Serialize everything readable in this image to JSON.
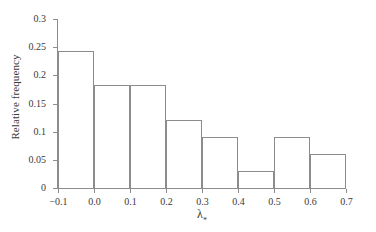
{
  "chart_data": {
    "type": "bar",
    "title": "",
    "subtitle": "",
    "xlabel": "λ",
    "xlabel_subscript": "*",
    "ylabel": "Relative frequency",
    "xlim": [
      -0.1,
      0.7
    ],
    "ylim": [
      0,
      0.3
    ],
    "grid": false,
    "legend": "none",
    "bin_width": 0.1,
    "bin_edges": [
      -0.1,
      0.0,
      0.1,
      0.2,
      0.3,
      0.4,
      0.5,
      0.6,
      0.7
    ],
    "categories": [
      "-0.1 to 0.0",
      "0.0 to 0.1",
      "0.1 to 0.2",
      "0.2 to 0.3",
      "0.3 to 0.4",
      "0.4 to 0.5",
      "0.5 to 0.6",
      "0.6 to 0.7"
    ],
    "values": [
      0.243,
      0.182,
      0.182,
      0.121,
      0.091,
      0.03,
      0.091,
      0.061
    ],
    "xticks": [
      {
        "value": -0.1,
        "label": "−0.1"
      },
      {
        "value": 0.0,
        "label": "0.0"
      },
      {
        "value": 0.1,
        "label": "0.1"
      },
      {
        "value": 0.2,
        "label": "0.2"
      },
      {
        "value": 0.3,
        "label": "0.3"
      },
      {
        "value": 0.4,
        "label": "0.4"
      },
      {
        "value": 0.5,
        "label": "0.5"
      },
      {
        "value": 0.6,
        "label": "0.6"
      },
      {
        "value": 0.7,
        "label": "0.7"
      }
    ],
    "yticks": [
      {
        "value": 0.0,
        "label": "0"
      },
      {
        "value": 0.05,
        "label": "0.05"
      },
      {
        "value": 0.1,
        "label": "0.1"
      },
      {
        "value": 0.15,
        "label": "0.15"
      },
      {
        "value": 0.2,
        "label": "0.2"
      },
      {
        "value": 0.25,
        "label": "0.25"
      },
      {
        "value": 0.3,
        "label": "0.3"
      }
    ],
    "colors": {
      "background": "#ffffff",
      "axis": "#8c8c8c",
      "bar_edge": "#8c8c8c",
      "bar_fill": "none",
      "text": "#3a3a3a"
    }
  }
}
